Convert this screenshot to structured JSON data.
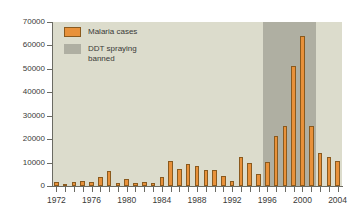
{
  "chart_data": {
    "type": "bar",
    "title": "",
    "xlabel": "",
    "ylabel": "",
    "ylim": [
      0,
      70000
    ],
    "xlim": [
      1972,
      2004
    ],
    "grid": false,
    "legend_position": "top-left",
    "y_ticks": [
      0,
      10000,
      20000,
      30000,
      40000,
      50000,
      60000,
      70000
    ],
    "y_tick_labels": [
      "0",
      "10000",
      "20000",
      "30000",
      "40000",
      "50000",
      "60000",
      "70000"
    ],
    "x_tick_labels": [
      "1972",
      "1976",
      "1980",
      "1984",
      "1988",
      "1992",
      "1996",
      "2000",
      "2004"
    ],
    "x_minor_ticks": [
      1972,
      1973,
      1974,
      1975,
      1976,
      1977,
      1978,
      1979,
      1980,
      1981,
      1982,
      1983,
      1984,
      1985,
      1986,
      1987,
      1988,
      1989,
      1990,
      1991,
      1992,
      1993,
      1994,
      1995,
      1996,
      1997,
      1998,
      1999,
      2000,
      2001,
      2002,
      2003,
      2004
    ],
    "categories": [
      1972,
      1973,
      1974,
      1975,
      1976,
      1977,
      1978,
      1979,
      1980,
      1981,
      1982,
      1983,
      1984,
      1985,
      1986,
      1987,
      1988,
      1989,
      1990,
      1991,
      1992,
      1993,
      1994,
      1995,
      1996,
      1997,
      1998,
      1999,
      2000,
      2001,
      2002,
      2003,
      2004
    ],
    "values": [
      1800,
      600,
      1700,
      2100,
      1800,
      3800,
      6500,
      1500,
      2800,
      1500,
      1700,
      1500,
      3900,
      10800,
      7100,
      9600,
      8700,
      6800,
      6800,
      4200,
      2300,
      12300,
      9700,
      5300,
      10400,
      21400,
      25600,
      51100,
      64000,
      25500,
      14300,
      12500,
      10800
    ],
    "series": [
      {
        "name": "Malaria cases",
        "color": "#e8913a",
        "values": [
          1800,
          600,
          1700,
          2100,
          1800,
          3800,
          6500,
          1500,
          2800,
          1500,
          1700,
          1500,
          3900,
          10800,
          7100,
          9600,
          8700,
          6800,
          6800,
          4200,
          2300,
          12300,
          9700,
          5300,
          10400,
          21400,
          25600,
          51100,
          64000,
          25500,
          14300,
          12500,
          10800
        ]
      }
    ],
    "shaded_region": {
      "label": "DDT spraying banned",
      "color": "#afafa2",
      "x_start": 1996,
      "x_end": 2001
    },
    "legend": [
      {
        "label": "Malaria cases",
        "color": "#e8913a",
        "icon": "orange-square-swatch"
      },
      {
        "label": "DDT spraying\nbanned",
        "color": "#afafa2",
        "icon": "gray-square-swatch"
      }
    ]
  },
  "colors": {
    "bar": "#e8913a",
    "bar_border": "#8a5a1e",
    "plot_background": "#dcdccc",
    "shaded_band": "#afafa2",
    "axis": "#6b6b63",
    "text": "#3a3a38",
    "page_background": "#ffffff"
  }
}
